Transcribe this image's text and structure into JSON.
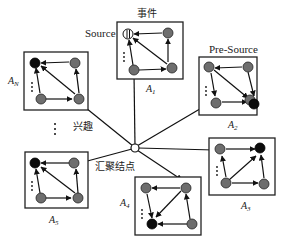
{
  "diagram": {
    "type": "star-topology network diagram",
    "center_node": {
      "label": "汇聚结点",
      "meaning": "sink node"
    },
    "labels": {
      "event": "事件",
      "source": "Source",
      "pre_source": "Pre-Source",
      "interest": "兴趣",
      "sink": "汇聚结点",
      "ellipsis": "⋮"
    },
    "areas": [
      {
        "id": "A1",
        "label": "A",
        "sub": "1"
      },
      {
        "id": "A2",
        "label": "A",
        "sub": "2"
      },
      {
        "id": "A3",
        "label": "A",
        "sub": "3"
      },
      {
        "id": "A4",
        "label": "A",
        "sub": "4"
      },
      {
        "id": "A5",
        "label": "A",
        "sub": "5"
      },
      {
        "id": "AN",
        "label": "A",
        "sub": "N"
      }
    ],
    "colors": {
      "node_gray": "#6e6e6e",
      "node_black": "#0c0c0c",
      "line": "#111111",
      "background": "#ffffff"
    }
  }
}
